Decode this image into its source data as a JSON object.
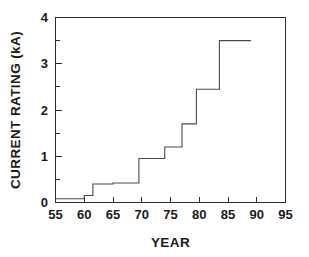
{
  "chart_data": {
    "type": "line",
    "subtype": "step-post",
    "title": "",
    "xlabel": "YEAR",
    "ylabel": "CURRENT RATING  (kA)",
    "xlim": [
      55,
      95
    ],
    "ylim": [
      0,
      4
    ],
    "grid": false,
    "legend": null,
    "x_ticks": [
      55,
      60,
      65,
      70,
      75,
      80,
      85,
      90,
      95
    ],
    "x_tick_labels": [
      "55",
      "60",
      "65",
      "70",
      "75",
      "80",
      "85",
      "90",
      "95"
    ],
    "x_minor_ticks": [],
    "y_ticks": [
      0,
      1,
      2,
      3,
      4
    ],
    "y_tick_labels": [
      "0",
      "1",
      "2",
      "3",
      "4"
    ],
    "y_minor_ticks": [
      0.5,
      1.5,
      2.5,
      3.5
    ],
    "series": [
      {
        "name": "Current rating",
        "color": "#4a4a4a",
        "x": [
          55,
          60,
          61.5,
          65,
          69.5,
          74,
          77,
          79.5,
          83.5,
          89
        ],
        "values": [
          0.08,
          0.15,
          0.4,
          0.42,
          0.95,
          1.2,
          1.7,
          2.45,
          3.5,
          3.5
        ],
        "points": [
          {
            "year": 55,
            "kA": 0.08
          },
          {
            "year": 60,
            "kA": 0.15
          },
          {
            "year": 61.5,
            "kA": 0.4
          },
          {
            "year": 65,
            "kA": 0.42
          },
          {
            "year": 69.5,
            "kA": 0.95
          },
          {
            "year": 74,
            "kA": 1.2
          },
          {
            "year": 77,
            "kA": 1.7
          },
          {
            "year": 79.5,
            "kA": 2.45
          },
          {
            "year": 83.5,
            "kA": 3.5
          },
          {
            "year": 89,
            "kA": 3.5
          }
        ]
      }
    ],
    "annotations": []
  },
  "axes": {
    "x_title": "YEAR",
    "y_title": "CURRENT RATING  (kA)"
  }
}
